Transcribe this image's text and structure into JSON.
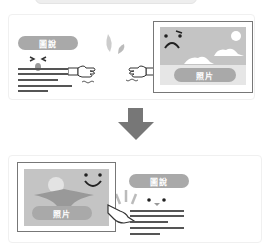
{
  "diagram": {
    "before": {
      "caption_label": "圖說",
      "photo_label": "照片",
      "photo_face": "sad",
      "caption_face": "squinting",
      "relation": "caption and photo pushing apart"
    },
    "after": {
      "caption_label": "圖說",
      "photo_label": "照片",
      "photo_face": "happy",
      "caption_face": "smiling",
      "relation": "caption adjacent to photo, hand pointing at photo"
    },
    "arrow": "down-arrow",
    "colors": {
      "pill": "#a9a9a9",
      "photo_bg": "#c4c4c4",
      "line": "#555555",
      "arrow": "#777777",
      "border": "#777777"
    }
  }
}
